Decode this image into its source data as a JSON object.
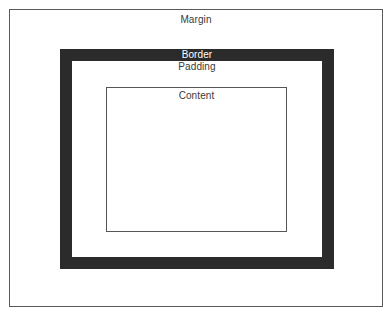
{
  "diagram": {
    "layers": {
      "margin": {
        "label": "Margin"
      },
      "border": {
        "label": "Border",
        "color": "#2b2b2b"
      },
      "padding": {
        "label": "Padding"
      },
      "content": {
        "label": "Content"
      }
    },
    "colors": {
      "background": "#ffffff",
      "outline": "#5a5a5a",
      "border_fill": "#2b2b2b",
      "text_dark": "#3a3a3a",
      "text_light": "#ffffff"
    }
  }
}
